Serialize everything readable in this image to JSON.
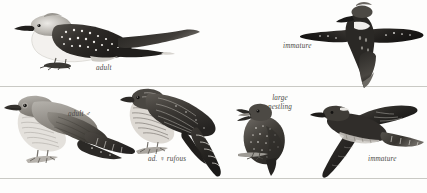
{
  "plate": {
    "width": 427,
    "height": 193,
    "background": "#fdfdfc",
    "rule_color": "#c9c9c4",
    "ink_dark": "#23211f",
    "ink_mid": "#6e6b66",
    "ink_light": "#b9b6b0",
    "caption_color": "#4a4a46"
  },
  "captions": [
    {
      "key": "adult_perched",
      "text": "adult",
      "x": 96,
      "y": 64
    },
    {
      "key": "immature_flight_top",
      "text": "immature",
      "x": 283,
      "y": 42
    },
    {
      "key": "adult_male",
      "text": "adult ♂",
      "x": 68,
      "y": 110
    },
    {
      "key": "ad_female_rufous",
      "text": "ad. ♀ rufous",
      "x": 148,
      "y": 155
    },
    {
      "key": "large_nestling",
      "text": "large\nnestling",
      "x": 266,
      "y": 94
    },
    {
      "key": "immature_flight_bottom",
      "text": "immature",
      "x": 368,
      "y": 155
    }
  ],
  "figures": [
    {
      "key": "great-spotted-cuckoo-adult-perched",
      "species": "Great Spotted Cuckoo",
      "age": "adult",
      "pose": "perched, facing left, long tail to right",
      "x": 14,
      "y": 10,
      "w": 180,
      "h": 60
    },
    {
      "key": "great-spotted-cuckoo-immature-flight",
      "species": "Great Spotted Cuckoo",
      "age": "immature",
      "pose": "flight from above, wings spread",
      "x": 300,
      "y": 2,
      "w": 126,
      "h": 84
    },
    {
      "key": "common-cuckoo-adult-male-perched",
      "species": "Common Cuckoo",
      "age": "adult male",
      "pose": "perched, facing left, grey",
      "x": 6,
      "y": 90,
      "w": 128,
      "h": 84
    },
    {
      "key": "common-cuckoo-adult-female-rufous-perched",
      "species": "Common Cuckoo",
      "age": "adult female rufous morph",
      "pose": "perched, facing left, barred rufous, tail down-right",
      "x": 122,
      "y": 86,
      "w": 124,
      "h": 88
    },
    {
      "key": "common-cuckoo-large-nestling",
      "species": "Common Cuckoo",
      "age": "large nestling",
      "pose": "perched on twig, bill open, facing left",
      "x": 238,
      "y": 104,
      "w": 56,
      "h": 70
    },
    {
      "key": "common-cuckoo-immature-flight",
      "species": "Common Cuckoo",
      "age": "immature",
      "pose": "flight in profile, wings swept",
      "x": 310,
      "y": 96,
      "w": 112,
      "h": 82
    }
  ],
  "rules": [
    {
      "key": "rule-upper",
      "y": 86
    },
    {
      "key": "rule-lower",
      "y": 178
    }
  ]
}
